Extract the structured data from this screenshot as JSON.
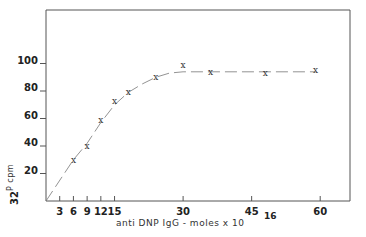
{
  "chart_data": {
    "type": "line",
    "title": "",
    "xlabel": "anti DNP IgG - moles x 10",
    "xlabel_exponent": "16",
    "ylabel": "32P cpm",
    "ylabel_superscript": "32",
    "ylabel_base": "P cpm",
    "xlim": [
      0,
      66
    ],
    "ylim": [
      0,
      125
    ],
    "x_ticks": [
      3,
      6,
      9,
      12,
      15,
      30,
      45,
      60
    ],
    "x_tick_labels": [
      "3",
      "6",
      "9",
      "12",
      "15",
      "30",
      "45",
      "60"
    ],
    "y_ticks": [
      20,
      40,
      60,
      80,
      100
    ],
    "y_tick_labels": [
      "20",
      "40",
      "60",
      "80",
      "100"
    ],
    "grid": false,
    "legend": null,
    "marker": "x",
    "series": [
      {
        "name": "32P cpm",
        "x": [
          6,
          9,
          12,
          15,
          18,
          24,
          30,
          36,
          48,
          59
        ],
        "y": [
          30,
          40,
          59,
          73,
          79,
          90,
          99,
          94,
          93,
          95
        ]
      }
    ],
    "fit_curve": {
      "description": "linear rise from origin to ~18, curving to plateau at ~94",
      "x": [
        0,
        6,
        9,
        12,
        15,
        18,
        21,
        24,
        27,
        30,
        36,
        48,
        59
      ],
      "y": [
        0,
        30,
        42,
        57,
        70,
        79,
        85,
        90,
        93,
        94,
        94,
        94,
        94
      ]
    }
  }
}
